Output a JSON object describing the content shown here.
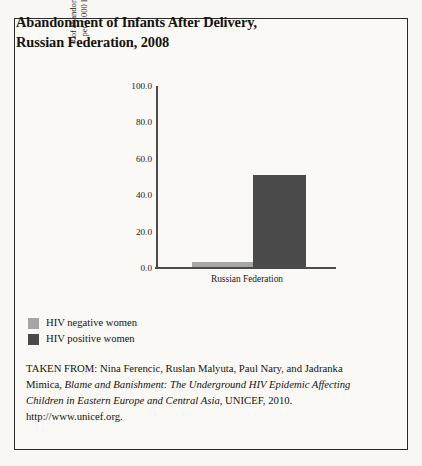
{
  "figure": {
    "title_line1": "Abandonment of Infants After Delivery,",
    "title_line2": "Russian Federation, 2008",
    "background_color": "#f8f7f3",
    "border_color": "#2b2b2b"
  },
  "chart_data": {
    "type": "bar",
    "title": "Abandonment of Infants After Delivery, Russian Federation, 2008",
    "xlabel": "",
    "ylabel": "# of abandoned children per 1,000 live births",
    "ylabel_line1": "# of abandoned children",
    "ylabel_line2": "per 1,000 live births",
    "categories": [
      "Russian Federation"
    ],
    "series": [
      {
        "name": "HIV negative women",
        "values": [
          2.5
        ],
        "color": "#a6a6a6"
      },
      {
        "name": "HIV positive women",
        "values": [
          51.0
        ],
        "color": "#4a4a4a"
      }
    ],
    "ylim": [
      0.0,
      100.0
    ],
    "ytick_values": [
      0.0,
      20.0,
      40.0,
      60.0,
      80.0,
      100.0
    ],
    "ytick_labels": [
      "0.0",
      "20.0",
      "40.0",
      "60.0",
      "80.0",
      "100.0"
    ],
    "grid": false,
    "legend_position": "below-left",
    "axis_color": "#4b4b4b"
  },
  "legend": {
    "items": [
      {
        "label": "HIV negative women",
        "color": "#a6a6a6"
      },
      {
        "label": "HIV positive women",
        "color": "#4a4a4a"
      }
    ]
  },
  "citation": {
    "prefix": "TAKEN FROM: Nina Ferencic, Ruslan Malyuta, Paul Nary, and Jadranka Mimica, ",
    "work_title": "Blame and Banishment: The Underground HIV Epidemic Affecting Children in Eastern Europe and Central Asia,",
    "suffix": " UNICEF, 2010. http://www.unicef.org."
  }
}
